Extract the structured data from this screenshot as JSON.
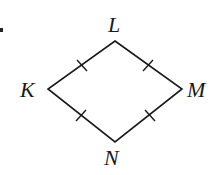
{
  "diagram": {
    "type": "rhombus",
    "vertices": {
      "L": {
        "label": "L",
        "x": 115,
        "y": 41
      },
      "K": {
        "label": "K",
        "x": 48,
        "y": 89
      },
      "M": {
        "label": "M",
        "x": 182,
        "y": 89
      },
      "N": {
        "label": "N",
        "x": 115,
        "y": 142
      }
    },
    "edges": [
      "KL",
      "LM",
      "MN",
      "NK"
    ],
    "tick_marks": "one tick on each side (all sides congruent)",
    "colors": {
      "stroke": "#1a1a1a",
      "background": "#ffffff"
    }
  }
}
